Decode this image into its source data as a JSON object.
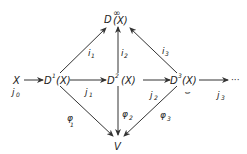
{
  "diagram": {
    "type": "commutative-diagram",
    "nodes": {
      "X": {
        "label": "X"
      },
      "D1": {
        "base": "D",
        "sup": "1",
        "arg": "(X)"
      },
      "D2": {
        "base": "D",
        "sup": "2",
        "arg": "(X)"
      },
      "D3": {
        "base": "D",
        "sup": "3",
        "arg": "(X)"
      },
      "Dinf": {
        "base": "D",
        "sup": "∞",
        "arg": "(X)"
      },
      "V": {
        "label": "V"
      },
      "ellipsis": {
        "label": "···"
      }
    },
    "edges": {
      "j0": {
        "label": "j",
        "sub": "0",
        "from": "X",
        "to": "D1"
      },
      "j1": {
        "label": "j",
        "sub": "1",
        "from": "D1",
        "to": "D2"
      },
      "j2": {
        "label": "j",
        "sub": "2",
        "from": "D2",
        "to": "D3"
      },
      "j3": {
        "label": "j",
        "sub": "3",
        "from": "D3",
        "to": "ellipsis"
      },
      "i1": {
        "label": "i",
        "sub": "1",
        "from": "D1",
        "to": "Dinf"
      },
      "i2": {
        "label": "i",
        "sub": "2",
        "from": "D2",
        "to": "Dinf"
      },
      "i3": {
        "label": "i",
        "sub": "3",
        "from": "D3",
        "to": "Dinf"
      },
      "phi1": {
        "label": "φ",
        "sub": "1",
        "from": "D1",
        "to": "V"
      },
      "phi2": {
        "label": "φ",
        "sub": "2",
        "from": "D2",
        "to": "V"
      },
      "phi3": {
        "label": "φ",
        "sub": "3",
        "from": "D3",
        "to": "V"
      }
    },
    "loop_mark": "⌣"
  }
}
